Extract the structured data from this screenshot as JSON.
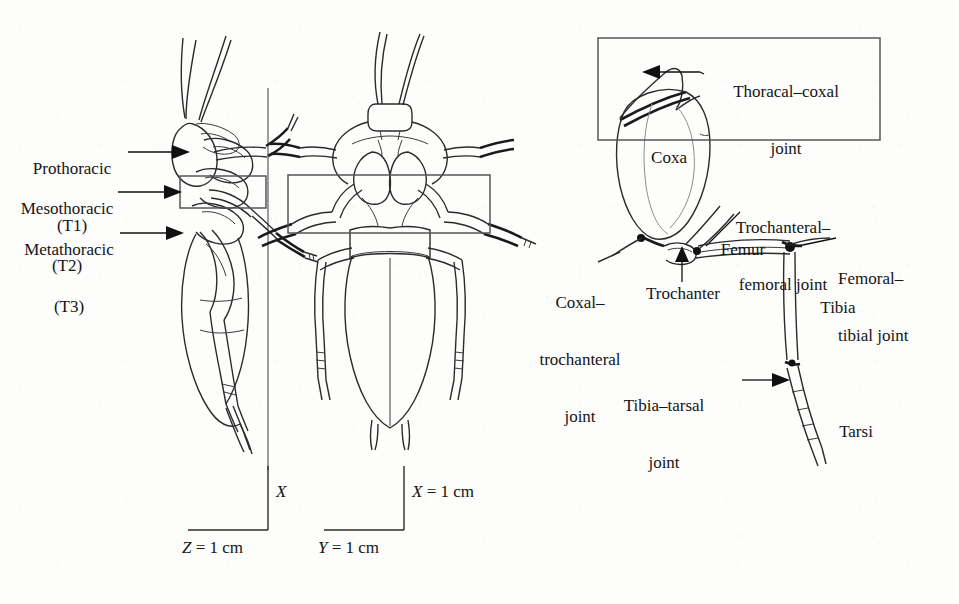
{
  "figure": {
    "kind": "anatomical-line-drawing",
    "views": [
      {
        "name": "lateral-view",
        "label": ""
      },
      {
        "name": "dorsal-view",
        "label": ""
      },
      {
        "name": "leg-detail-view",
        "label": ""
      }
    ]
  },
  "segment_labels": [
    {
      "line1": "Prothoracic",
      "line2": "(T1)"
    },
    {
      "line1": "Mesothoracic",
      "line2": "(T2)"
    },
    {
      "line1": "Metathoracic",
      "line2": "(T3)"
    }
  ],
  "leg_labels": {
    "thoracal_coxal_joint_line1": "Thoracal–coxal",
    "thoracal_coxal_joint_line2": "joint",
    "coxa": "Coxa",
    "coxal_trochanteral_joint_line1": "Coxal–",
    "coxal_trochanteral_joint_line2": "trochanteral",
    "coxal_trochanteral_joint_line3": "joint",
    "trochanter": "Trochanter",
    "trochanteral_femoral_joint_line1": "Trochanteral–",
    "trochanteral_femoral_joint_line2": "femoral joint",
    "femur": "Femur",
    "femoral_tibial_joint_line1": "Femoral–",
    "femoral_tibial_joint_line2": "tibial joint",
    "tibia": "Tibia",
    "tibia_tarsal_joint_line1": "Tibia–tarsal",
    "tibia_tarsal_joint_line2": "joint",
    "tarsi": "Tarsi"
  },
  "scale_bars": [
    {
      "name": "lateral-scale",
      "vertical_axis": "X",
      "horizontal_axis": "Z = 1 cm"
    },
    {
      "name": "dorsal-scale",
      "vertical_axis": "X = 1 cm",
      "horizontal_axis": "Y = 1 cm"
    }
  ],
  "colors": {
    "background": "#fdfdfc",
    "ink": "#2b2b2b",
    "ink_light": "#8c8c8c",
    "box_stroke": "#555555",
    "arrow": "#101010"
  }
}
